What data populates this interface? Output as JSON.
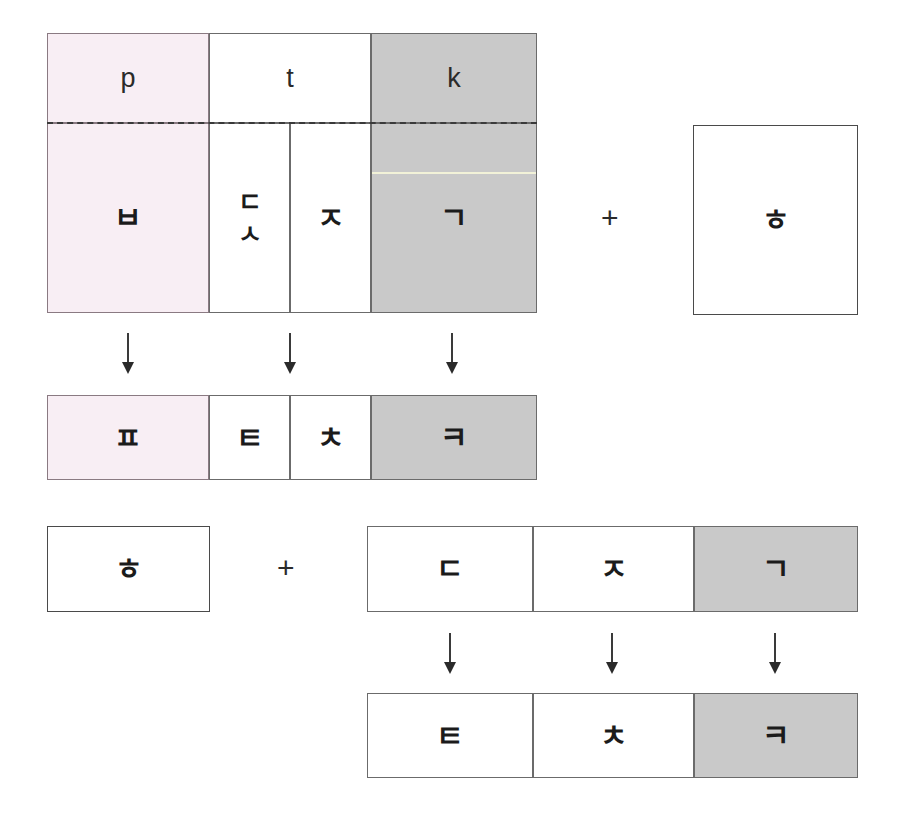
{
  "diagram": {
    "colors": {
      "pink": "#f8eef4",
      "gray": "#c9c9c9",
      "white": "#ffffff",
      "border": "#6b6b6b",
      "dashed": "#3a3a3a",
      "text": "#1b1b1b",
      "hairline": "#f2f2d8"
    },
    "group1": {
      "source_table": {
        "top_row": [
          {
            "label": "p",
            "fill": "pink"
          },
          {
            "label": "t",
            "fill": "white"
          },
          {
            "label": "k",
            "fill": "gray"
          }
        ],
        "bottom_row": [
          {
            "label": "ㅂ",
            "fill": "pink"
          },
          {
            "label": "ㄷ\nㅅ",
            "stacked": [
              "ㄷ",
              "ㅅ"
            ],
            "fill": "white"
          },
          {
            "label": "ㅈ",
            "fill": "white"
          },
          {
            "label": "ㄱ",
            "fill": "gray"
          }
        ]
      },
      "operator": "+",
      "operand_box": {
        "label": "ㅎ",
        "fill": "white"
      },
      "arrows": [
        "↓",
        "↓",
        "↓"
      ],
      "result_table": [
        {
          "label": "ㅍ",
          "fill": "pink"
        },
        {
          "label": "ㅌ",
          "fill": "white"
        },
        {
          "label": "ㅊ",
          "fill": "white"
        },
        {
          "label": "ㅋ",
          "fill": "gray"
        }
      ]
    },
    "group2": {
      "operand_box": {
        "label": "ㅎ",
        "fill": "white"
      },
      "operator": "+",
      "source_table": [
        {
          "label": "ㄷ",
          "fill": "white"
        },
        {
          "label": "ㅈ",
          "fill": "white"
        },
        {
          "label": "ㄱ",
          "fill": "gray"
        }
      ],
      "arrows": [
        "↓",
        "↓",
        "↓"
      ],
      "result_table": [
        {
          "label": "ㅌ",
          "fill": "white"
        },
        {
          "label": "ㅊ",
          "fill": "white"
        },
        {
          "label": "ㅋ",
          "fill": "gray"
        }
      ]
    }
  }
}
